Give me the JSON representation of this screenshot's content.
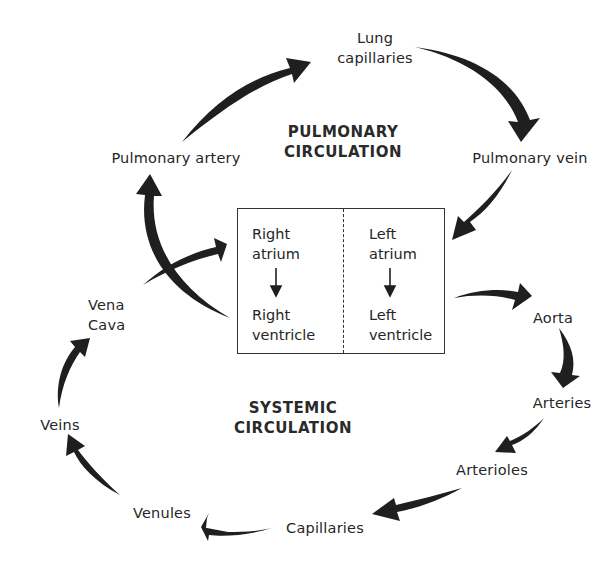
{
  "diagram": {
    "sections": {
      "pulmonary": "PULMONARY\nCIRCULATION",
      "systemic": "SYSTEMIC\nCIRCULATION"
    },
    "heart": {
      "right_atrium": "Right\natrium",
      "right_ventricle": "Right\nventricle",
      "left_atrium": "Left\natrium",
      "left_ventricle": "Left\nventricle"
    },
    "nodes": {
      "lung_capillaries": "Lung\ncapillaries",
      "pulmonary_artery": "Pulmonary artery",
      "pulmonary_vein": "Pulmonary vein",
      "vena_cava": "Vena\nCava",
      "aorta": "Aorta",
      "arteries": "Arteries",
      "arterioles": "Arterioles",
      "capillaries": "Capillaries",
      "venules": "Venules",
      "veins": "Veins"
    },
    "flow": [
      "Right ventricle → Pulmonary artery",
      "Pulmonary artery → Lung capillaries",
      "Lung capillaries → Pulmonary vein",
      "Pulmonary vein → Left atrium",
      "Left atrium → Left ventricle",
      "Left ventricle → Aorta",
      "Aorta → Arteries",
      "Arteries → Arterioles",
      "Arterioles → Capillaries",
      "Capillaries → Venules",
      "Venules → Veins",
      "Veins → Vena Cava",
      "Vena Cava → Right atrium",
      "Right atrium → Right ventricle"
    ],
    "colors": {
      "arrow": "#1f1f1f",
      "text": "#262626",
      "background": "#ffffff"
    }
  }
}
